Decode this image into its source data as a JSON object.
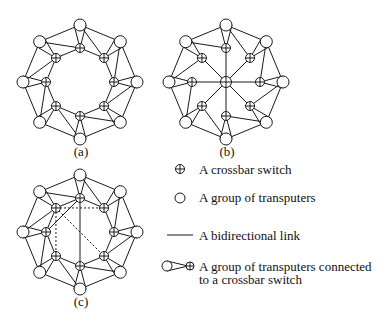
{
  "diagrams": [
    {
      "id": "a",
      "caption": "(a)",
      "center": [
        80,
        82
      ],
      "variant": "ring"
    },
    {
      "id": "b",
      "caption": "(b)",
      "center": [
        226,
        82
      ],
      "variant": "star"
    },
    {
      "id": "c",
      "caption": "(c)",
      "center": [
        80,
        232
      ],
      "variant": "ring-chords"
    }
  ],
  "geometry": {
    "outer_radius": 57,
    "inner_radius": 34,
    "node_radius": 6,
    "switch_radius": 4.5,
    "node_count": 8
  },
  "legend": {
    "items": [
      {
        "symbol": "crossbar-switch",
        "label": "A crossbar switch"
      },
      {
        "symbol": "transputer-group",
        "label": "A group of transputers"
      },
      {
        "symbol": "bidirectional-link",
        "label": "A bidirectional link"
      },
      {
        "symbol": "group-connected-to-switch",
        "label": "A group of transputers connected",
        "label2": "to a crossbar switch"
      }
    ]
  },
  "colors": {
    "stroke": "#1a1a1a",
    "background": "#ffffff"
  }
}
